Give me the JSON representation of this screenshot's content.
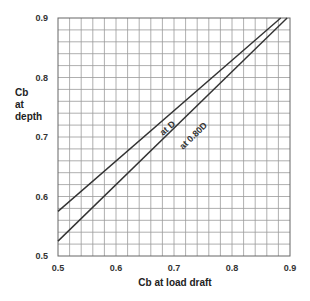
{
  "chart_data": {
    "type": "line",
    "title": "",
    "xlabel": "Cb at load draft",
    "ylabel": "Cb at depth",
    "xlim": [
      0.5,
      0.9
    ],
    "ylim": [
      0.5,
      0.9
    ],
    "x_ticks": [
      "0.5",
      "0.6",
      "0.7",
      "0.8",
      "0.9"
    ],
    "y_ticks": [
      "0.5",
      "0.6",
      "0.7",
      "0.8",
      "0.9"
    ],
    "grid": true,
    "grid_step": 0.02,
    "series": [
      {
        "name": "at D",
        "x": [
          0.5,
          0.884
        ],
        "y": [
          0.575,
          0.9
        ]
      },
      {
        "name": "at 0.80D",
        "x": [
          0.5,
          0.895
        ],
        "y": [
          0.525,
          0.9
        ]
      }
    ],
    "annotations": [
      {
        "text": "at D",
        "x": 0.685,
        "y": 0.71
      },
      {
        "text": "at 0.80D",
        "x": 0.72,
        "y": 0.705
      }
    ],
    "legend": "none (inline line labels)"
  },
  "axis": {
    "x_label": "Cb at load draft",
    "y_label_lines": [
      "Cb",
      "at",
      "depth"
    ]
  }
}
